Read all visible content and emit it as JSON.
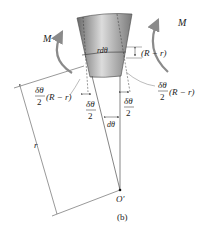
{
  "figure": {
    "caption": "(b)",
    "moment_left": "M",
    "moment_right": "M",
    "arc_label": "rdθ",
    "offset_label": "(R − r)",
    "left_note_num": "δθ",
    "left_note_den": "2",
    "left_note_factor": "(R − r)",
    "right_note_num": "δθ",
    "right_note_den": "2",
    "right_note_factor": "(R − r)",
    "inner_left_num": "δθ",
    "inner_left_den": "2",
    "inner_right_num": "δθ",
    "inner_right_den": "2",
    "angle_label": "dθ",
    "radius_label": "r",
    "center_label": "O′"
  },
  "colors": {
    "element_dark": "#6e6e6e",
    "element_light": "#d8d8d8",
    "arrow": "#8a8a8a",
    "line": "#333333"
  }
}
